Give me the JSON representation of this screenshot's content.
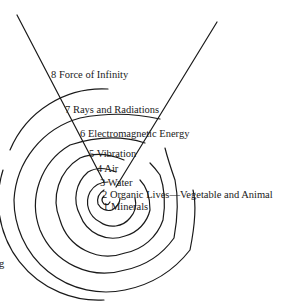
{
  "diagram": {
    "type": "spiral",
    "stroke_color": "#1a1a1a",
    "background_color": "#ffffff",
    "labels": [
      {
        "id": 8,
        "text": "8 Force of Infinity"
      },
      {
        "id": 7,
        "text": "7 Rays and Radiations"
      },
      {
        "id": 6,
        "text": "6 Electromagnetic Energy"
      },
      {
        "id": 5,
        "text": "5 Vibration"
      },
      {
        "id": 4,
        "text": "4 Air"
      },
      {
        "id": 3,
        "text": "3 Water"
      },
      {
        "id": 2,
        "text": "2 Organic Lives—Vegetable and Animal"
      },
      {
        "id": 1,
        "text": "1 Minerals"
      }
    ],
    "edge_fragment": "g"
  }
}
